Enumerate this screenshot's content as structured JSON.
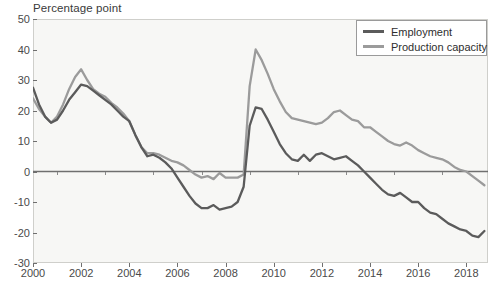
{
  "chart_data": {
    "type": "line",
    "title": "Percentage point",
    "xlabel": "",
    "ylabel": "Percentage point",
    "xlim": [
      2000.0,
      2018.9
    ],
    "ylim": [
      -30,
      50
    ],
    "yticks": [
      50,
      40,
      30,
      20,
      10,
      0,
      -10,
      -20,
      -30
    ],
    "xticks": [
      2000,
      2002,
      2004,
      2006,
      2008,
      2010,
      2012,
      2014,
      2016,
      2018
    ],
    "grid": false,
    "zero_line": true,
    "legend_position": "top-right",
    "colors": {
      "employment": "#5b5b5b",
      "production_capacity": "#9b9b9b",
      "plot_background": "#f7f7f5",
      "frame": "#cfcfcb",
      "axis_text": "#4a4a4a"
    },
    "x": [
      2000.0,
      2000.25,
      2000.5,
      2000.75,
      2001.0,
      2001.25,
      2001.5,
      2001.75,
      2002.0,
      2002.25,
      2002.5,
      2002.75,
      2003.0,
      2003.25,
      2003.5,
      2003.75,
      2004.0,
      2004.25,
      2004.5,
      2004.75,
      2005.0,
      2005.25,
      2005.5,
      2005.75,
      2006.0,
      2006.25,
      2006.5,
      2006.75,
      2007.0,
      2007.25,
      2007.5,
      2007.75,
      2008.0,
      2008.25,
      2008.5,
      2008.75,
      2009.0,
      2009.25,
      2009.5,
      2009.75,
      2010.0,
      2010.25,
      2010.5,
      2010.75,
      2011.0,
      2011.25,
      2011.5,
      2011.75,
      2012.0,
      2012.25,
      2012.5,
      2012.75,
      2013.0,
      2013.25,
      2013.5,
      2013.75,
      2014.0,
      2014.25,
      2014.5,
      2014.75,
      2015.0,
      2015.25,
      2015.5,
      2015.75,
      2016.0,
      2016.25,
      2016.5,
      2016.75,
      2017.0,
      2017.25,
      2017.5,
      2017.75,
      2018.0,
      2018.25,
      2018.5,
      2018.75
    ],
    "series": [
      {
        "name": "Employment",
        "color": "#5b5b5b",
        "values": [
          27.5,
          22.0,
          18.0,
          16.0,
          17.0,
          20.0,
          23.5,
          26.0,
          28.5,
          28.0,
          26.5,
          25.0,
          23.5,
          22.0,
          20.0,
          18.0,
          16.5,
          12.0,
          8.0,
          5.0,
          5.5,
          4.5,
          3.0,
          1.0,
          -2.0,
          -5.0,
          -8.0,
          -10.5,
          -12.0,
          -12.0,
          -11.0,
          -12.5,
          -12.0,
          -11.5,
          -10.0,
          -5.0,
          15.0,
          21.0,
          20.5,
          17.0,
          13.0,
          9.0,
          6.0,
          4.0,
          3.5,
          5.5,
          3.5,
          5.5,
          6.0,
          5.0,
          4.0,
          4.5,
          5.0,
          3.5,
          2.0,
          0.0,
          -2.0,
          -4.0,
          -6.0,
          -7.5,
          -8.0,
          -7.0,
          -8.5,
          -10.0,
          -10.0,
          -12.0,
          -13.5,
          -14.0,
          -15.5,
          -17.0,
          -18.0,
          -19.0,
          -19.5,
          -21.0,
          -21.5,
          -19.5
        ]
      },
      {
        "name": "Production capacity",
        "color": "#9b9b9b",
        "values": [
          24.0,
          20.5,
          18.0,
          16.0,
          18.0,
          22.0,
          27.0,
          31.0,
          33.5,
          30.0,
          27.0,
          25.5,
          24.5,
          22.5,
          21.0,
          19.0,
          16.5,
          12.0,
          8.0,
          6.0,
          6.0,
          5.5,
          4.5,
          3.5,
          3.0,
          2.0,
          0.5,
          -1.0,
          -2.0,
          -1.5,
          -2.5,
          -0.5,
          -2.0,
          -2.0,
          -2.0,
          -1.0,
          28.0,
          40.0,
          36.5,
          32.0,
          27.0,
          23.0,
          19.5,
          17.5,
          17.0,
          16.5,
          16.0,
          15.5,
          16.0,
          17.5,
          19.5,
          20.0,
          18.5,
          17.0,
          16.5,
          14.5,
          14.5,
          13.0,
          11.5,
          10.0,
          9.0,
          8.5,
          9.5,
          8.5,
          7.0,
          6.0,
          5.0,
          4.5,
          4.0,
          3.0,
          1.5,
          0.5,
          0.0,
          -1.5,
          -3.0,
          -4.5
        ]
      }
    ]
  },
  "legend": {
    "items": [
      {
        "label": "Employment"
      },
      {
        "label": "Production capacity"
      }
    ]
  }
}
